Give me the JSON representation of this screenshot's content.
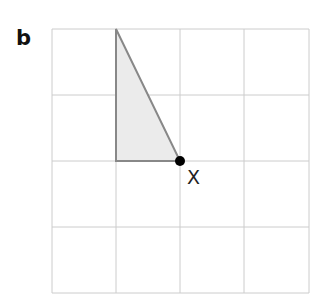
{
  "panel_label": "b",
  "point_label": "X",
  "grid": {
    "cols": 4,
    "rows": 4,
    "left": 52,
    "top": 29,
    "cell_w": 64.25,
    "cell_h": 66,
    "color": "#cccccc"
  },
  "triangle": {
    "points": [
      [
        116,
        29
      ],
      [
        116,
        161
      ],
      [
        180,
        161
      ]
    ],
    "fill": "#ebebeb",
    "stroke": "#888888"
  },
  "point": {
    "x": 180,
    "y": 161,
    "color": "#000000"
  }
}
